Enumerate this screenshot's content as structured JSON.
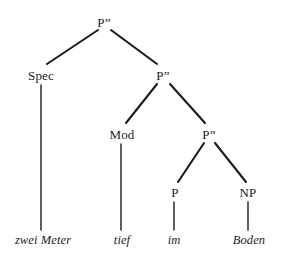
{
  "figure": {
    "kind": "syntax-tree-diagram",
    "background_color": "#ffffff",
    "line_color": "#1b1b1b",
    "text_color": "#1b1b1b",
    "width": 283,
    "height": 260
  },
  "nodes": [
    {
      "id": "root",
      "label": "P”",
      "x": 104,
      "y": 22,
      "type": "nonterminal"
    },
    {
      "id": "spec",
      "label": "Spec",
      "x": 41,
      "y": 75,
      "type": "nonterminal"
    },
    {
      "id": "pbar2",
      "label": "P”",
      "x": 163,
      "y": 75,
      "type": "nonterminal"
    },
    {
      "id": "mod",
      "label": "Mod",
      "x": 122,
      "y": 134,
      "type": "nonterminal"
    },
    {
      "id": "pbar3",
      "label": "P”",
      "x": 209,
      "y": 134,
      "type": "nonterminal"
    },
    {
      "id": "p",
      "label": "P",
      "x": 175,
      "y": 192,
      "type": "nonterminal"
    },
    {
      "id": "np",
      "label": "NP",
      "x": 248,
      "y": 192,
      "type": "nonterminal"
    },
    {
      "id": "t1",
      "label": "zwei Meter",
      "x": 43,
      "y": 240,
      "type": "terminal"
    },
    {
      "id": "t2",
      "label": "tief",
      "x": 122,
      "y": 240,
      "type": "terminal"
    },
    {
      "id": "t3",
      "label": "im",
      "x": 174,
      "y": 240,
      "type": "terminal"
    },
    {
      "id": "t4",
      "label": "Boden",
      "x": 249,
      "y": 240,
      "type": "terminal"
    }
  ],
  "edges": [
    {
      "id": "root-spec",
      "from": "root",
      "to": "spec",
      "x1": 98,
      "y1": 30,
      "x2": 47,
      "y2": 64
    },
    {
      "id": "root-pbar2",
      "from": "root",
      "to": "pbar2",
      "x1": 111,
      "y1": 30,
      "x2": 157,
      "y2": 64
    },
    {
      "id": "spec-t1",
      "from": "spec",
      "to": "t1",
      "x1": 41,
      "y1": 85,
      "x2": 41,
      "y2": 230
    },
    {
      "id": "pbar2-mod",
      "from": "pbar2",
      "to": "mod",
      "x1": 157,
      "y1": 84,
      "x2": 126,
      "y2": 123
    },
    {
      "id": "pbar2-pbar3",
      "from": "pbar2",
      "to": "pbar3",
      "x1": 170,
      "y1": 84,
      "x2": 205,
      "y2": 123
    },
    {
      "id": "mod-t2",
      "from": "mod",
      "to": "t2",
      "x1": 121,
      "y1": 144,
      "x2": 121,
      "y2": 230
    },
    {
      "id": "pbar3-p",
      "from": "pbar3",
      "to": "p",
      "x1": 204,
      "y1": 143,
      "x2": 178,
      "y2": 182
    },
    {
      "id": "pbar3-np",
      "from": "pbar3",
      "to": "np",
      "x1": 215,
      "y1": 143,
      "x2": 246,
      "y2": 182
    },
    {
      "id": "p-t3",
      "from": "p",
      "to": "t3",
      "x1": 174,
      "y1": 202,
      "x2": 174,
      "y2": 230
    },
    {
      "id": "np-t4",
      "from": "np",
      "to": "t4",
      "x1": 248,
      "y1": 202,
      "x2": 248,
      "y2": 230
    }
  ]
}
